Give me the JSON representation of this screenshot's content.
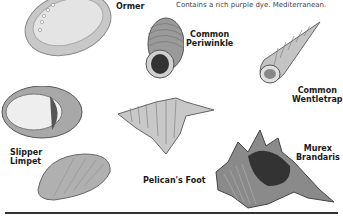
{
  "caption": "Contains a rich purple dye. Mediterranean.",
  "shells": [
    {
      "name": "Ormer"
    },
    {
      "name": "Common\nPeriwinkle",
      "line1": "Common",
      "line2": "Periwinkle"
    },
    {
      "name": "Common Wentletrap",
      "line1": "Common",
      "line2": "Wentletrap"
    },
    {
      "name": "Slipper Limpet",
      "line1": "Slipper",
      "line2": "Limpet"
    },
    {
      "name": "Pelican's Foot"
    },
    {
      "name": "Murex Brandaris",
      "line1": "Murex",
      "line2": "Brandaris"
    }
  ]
}
